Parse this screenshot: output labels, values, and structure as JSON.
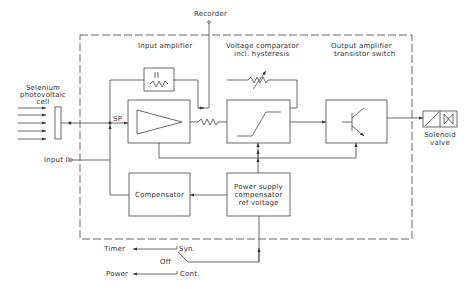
{
  "labels": {
    "recorder": "Recorder",
    "input_amplifier": "Input amplifier",
    "comparator_line1": "Voltage comparator",
    "comparator_line2": "incl. hysteresis",
    "output_line1": "Output amplifier",
    "output_line2": "transistor switch",
    "selenium_line1": "Selenium",
    "selenium_line2": "photovoltaic",
    "selenium_line3": "cell",
    "sp": "SP",
    "input2": "Input II",
    "compensator": "Compensator",
    "power_line1": "Power supply",
    "power_line2": "compensator",
    "power_line3": "ref voltage",
    "solenoid_line1": "Solenoid",
    "solenoid_line2": "valve",
    "timer": "Timer",
    "power": "Power",
    "syn": "Syn.",
    "off": "Off",
    "cont": "Cont.",
    "r1": "R1",
    "c1": "C1"
  },
  "colors": {
    "line": "#444444",
    "text": "#333333"
  }
}
